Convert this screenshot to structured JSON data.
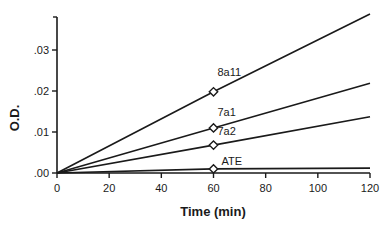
{
  "chart_data": {
    "type": "line",
    "title": "",
    "xlabel": "Time (min)",
    "ylabel": "O.D.",
    "xlim": [
      0,
      120
    ],
    "ylim": [
      0,
      0.039
    ],
    "x_ticks": [
      0,
      20,
      40,
      60,
      80,
      100,
      120
    ],
    "x_tick_labels": [
      "0",
      "20",
      "40",
      "60",
      "80",
      "100",
      "120"
    ],
    "y_ticks": [
      0,
      0.01,
      0.02,
      0.03
    ],
    "y_tick_labels": [
      ".00",
      ".01",
      ".02",
      ".03"
    ],
    "grid": false,
    "legend": "inline labels near markers at t=60",
    "x": [
      0,
      60,
      120
    ],
    "series": [
      {
        "name": "8a11",
        "values": [
          0,
          0.0198,
          0.0388
        ]
      },
      {
        "name": "7a1",
        "values": [
          0,
          0.011,
          0.0219
        ]
      },
      {
        "name": "7a2",
        "values": [
          0,
          0.0068,
          0.0137
        ]
      },
      {
        "name": "ATE",
        "values": [
          0,
          0.001,
          0.0012
        ]
      }
    ],
    "markers": "open diamond at t=60"
  }
}
